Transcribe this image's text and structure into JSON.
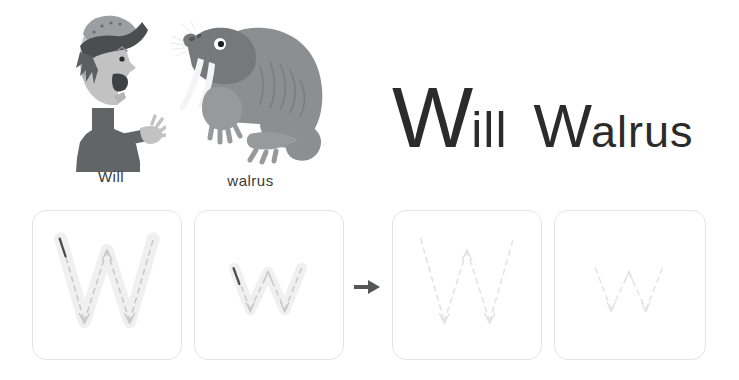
{
  "page": {
    "background": "#ffffff",
    "text_color": "#2b2b2b",
    "box_border_color": "#e2e4e6",
    "guide_color": "#c9c9ca",
    "guide_faint_color": "#e3e3e4",
    "stroke_fill_color": "#f0f0f1",
    "arrow_color": "#555759"
  },
  "illustrations": {
    "boy": {
      "name": "boy-illustration",
      "caption": "Will",
      "colors": {
        "skin": "#c2c2c2",
        "hat": "#6f7073",
        "hat_brim": "#4c4d50",
        "hair": "#5d5e61",
        "shirt": "#636466",
        "mouth": "#3f4042",
        "eye": "#2b2b2b"
      }
    },
    "walrus": {
      "name": "walrus-illustration",
      "caption": "walrus",
      "colors": {
        "body": "#8d8e90",
        "head": "#77787b",
        "flipper": "#98999b",
        "tusk": "#f4f4f4",
        "eye_white": "#ffffff",
        "eye_pupil": "#1f1f1f",
        "wrinkle": "#6f7073"
      }
    }
  },
  "title": {
    "word1_capital": "W",
    "word1_rest": "ill",
    "word2_capital": "W",
    "word2_rest": "alrus",
    "full_text": "Will Walrus"
  },
  "trace_exercise": {
    "letter": "W",
    "arrow_symbol": "→",
    "boxes": [
      {
        "id": "box-1",
        "letter": "W",
        "case": "uppercase",
        "style": "filled-with-dashed-guide",
        "has_start_tick": true
      },
      {
        "id": "box-2",
        "letter": "w",
        "case": "lowercase",
        "style": "filled-with-dashed-guide",
        "has_start_tick": true
      },
      {
        "id": "box-3",
        "letter": "W",
        "case": "uppercase",
        "style": "dashed-guide-only",
        "has_start_tick": false
      },
      {
        "id": "box-4",
        "letter": "w",
        "case": "lowercase",
        "style": "dashed-guide-faint",
        "has_start_tick": false
      }
    ]
  }
}
